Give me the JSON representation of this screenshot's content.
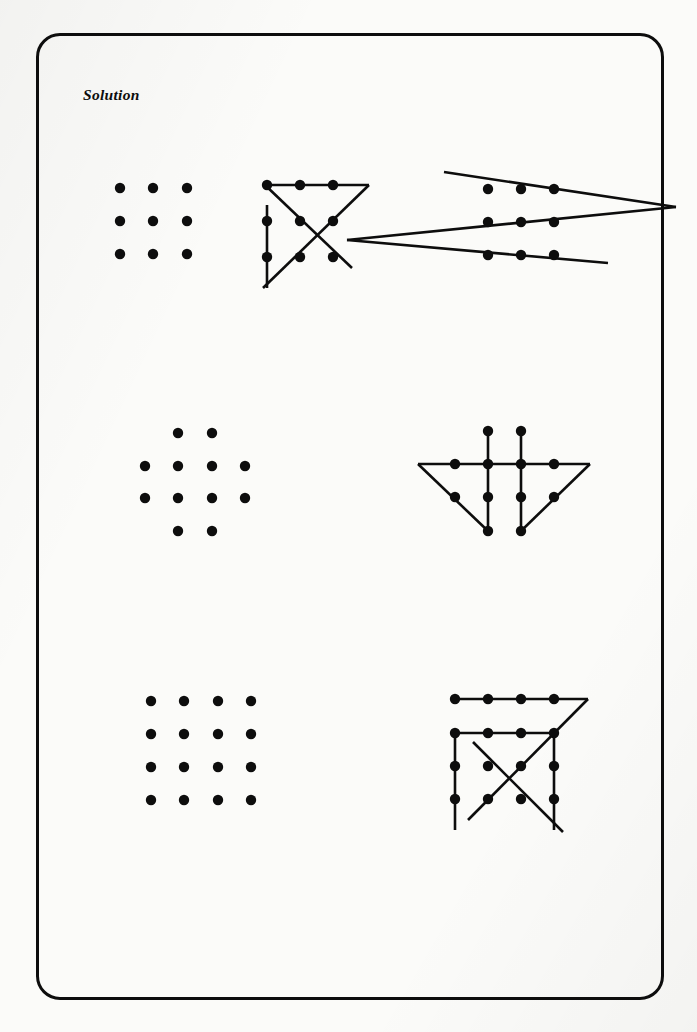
{
  "page": {
    "title": "Solution",
    "background_color": "#fbfbf9",
    "ink_color": "#0d0d0d",
    "border": {
      "x": 36,
      "y": 33,
      "width": 628,
      "height": 967,
      "radius": 24,
      "thickness": 3
    }
  },
  "puzzles": [
    {
      "id": "puzzle-1",
      "name": "nine-dot-three-by-three",
      "dot_radius": 5.2,
      "grid": {
        "name": "dot-grid-3x3",
        "rows": 3,
        "cols": 3,
        "dots": [
          {
            "x": 120,
            "y": 188
          },
          {
            "x": 153,
            "y": 188
          },
          {
            "x": 187,
            "y": 188
          },
          {
            "x": 120,
            "y": 221
          },
          {
            "x": 153,
            "y": 221
          },
          {
            "x": 187,
            "y": 221
          },
          {
            "x": 120,
            "y": 254
          },
          {
            "x": 153,
            "y": 254
          },
          {
            "x": 187,
            "y": 254
          }
        ]
      },
      "solutions": [
        {
          "name": "four-line-solution",
          "dots": [
            {
              "x": 267,
              "y": 185
            },
            {
              "x": 300,
              "y": 185
            },
            {
              "x": 333,
              "y": 185
            },
            {
              "x": 267,
              "y": 221
            },
            {
              "x": 300,
              "y": 221
            },
            {
              "x": 333,
              "y": 221
            },
            {
              "x": 267,
              "y": 257
            },
            {
              "x": 300,
              "y": 257
            },
            {
              "x": 333,
              "y": 257
            }
          ],
          "lines": [
            {
              "name": "top-horizontal",
              "x1": 267,
              "y1": 185,
              "x2": 369,
              "y2": 185
            },
            {
              "name": "diagonal-down-left",
              "x1": 369,
              "y1": 185,
              "x2": 263,
              "y2": 288
            },
            {
              "name": "left-vertical",
              "x1": 267,
              "y1": 205,
              "x2": 267,
              "y2": 288
            },
            {
              "name": "diagonal-up-right",
              "x1": 265,
              "y1": 185,
              "x2": 352,
              "y2": 268
            }
          ]
        },
        {
          "name": "three-line-solution",
          "dots": [
            {
              "x": 488,
              "y": 189
            },
            {
              "x": 521,
              "y": 189
            },
            {
              "x": 554,
              "y": 189
            },
            {
              "x": 488,
              "y": 222
            },
            {
              "x": 521,
              "y": 222
            },
            {
              "x": 554,
              "y": 222
            },
            {
              "x": 488,
              "y": 255
            },
            {
              "x": 521,
              "y": 255
            },
            {
              "x": 554,
              "y": 255
            }
          ],
          "lines": [
            {
              "name": "upper-line",
              "x1": 444,
              "y1": 172,
              "x2": 676,
              "y2": 207
            },
            {
              "name": "middle-line",
              "x1": 347,
              "y1": 240,
              "x2": 676,
              "y2": 207
            },
            {
              "name": "lower-line",
              "x1": 347,
              "y1": 240,
              "x2": 608,
              "y2": 263
            }
          ]
        }
      ]
    },
    {
      "id": "puzzle-2",
      "name": "twelve-dot-diamond",
      "dot_radius": 5.2,
      "grid": {
        "name": "dot-grid-diamond",
        "dots": [
          {
            "x": 178,
            "y": 433
          },
          {
            "x": 212,
            "y": 433
          },
          {
            "x": 145,
            "y": 466
          },
          {
            "x": 178,
            "y": 466
          },
          {
            "x": 212,
            "y": 466
          },
          {
            "x": 245,
            "y": 466
          },
          {
            "x": 145,
            "y": 498
          },
          {
            "x": 178,
            "y": 498
          },
          {
            "x": 212,
            "y": 498
          },
          {
            "x": 245,
            "y": 498
          },
          {
            "x": 178,
            "y": 531
          },
          {
            "x": 212,
            "y": 531
          }
        ]
      },
      "solutions": [
        {
          "name": "five-line-solution",
          "dots": [
            {
              "x": 488,
              "y": 431
            },
            {
              "x": 521,
              "y": 431
            },
            {
              "x": 455,
              "y": 464
            },
            {
              "x": 488,
              "y": 464
            },
            {
              "x": 521,
              "y": 464
            },
            {
              "x": 554,
              "y": 464
            },
            {
              "x": 455,
              "y": 497
            },
            {
              "x": 488,
              "y": 497
            },
            {
              "x": 521,
              "y": 497
            },
            {
              "x": 554,
              "y": 497
            },
            {
              "x": 488,
              "y": 531
            },
            {
              "x": 521,
              "y": 531
            }
          ],
          "lines": [
            {
              "name": "horizontal",
              "x1": 418,
              "y1": 464,
              "x2": 590,
              "y2": 464
            },
            {
              "name": "left-vertical",
              "x1": 488,
              "y1": 431,
              "x2": 488,
              "y2": 531
            },
            {
              "name": "right-vertical",
              "x1": 521,
              "y1": 431,
              "x2": 521,
              "y2": 531
            },
            {
              "name": "left-diagonal",
              "x1": 418,
              "y1": 464,
              "x2": 488,
              "y2": 531
            },
            {
              "name": "right-diagonal",
              "x1": 590,
              "y1": 464,
              "x2": 521,
              "y2": 531
            }
          ]
        }
      ]
    },
    {
      "id": "puzzle-3",
      "name": "sixteen-dot-four-by-four",
      "dot_radius": 5.2,
      "grid": {
        "name": "dot-grid-4x4",
        "rows": 4,
        "cols": 4,
        "dots": [
          {
            "x": 151,
            "y": 701
          },
          {
            "x": 184,
            "y": 701
          },
          {
            "x": 218,
            "y": 701
          },
          {
            "x": 251,
            "y": 701
          },
          {
            "x": 151,
            "y": 734
          },
          {
            "x": 184,
            "y": 734
          },
          {
            "x": 218,
            "y": 734
          },
          {
            "x": 251,
            "y": 734
          },
          {
            "x": 151,
            "y": 767
          },
          {
            "x": 184,
            "y": 767
          },
          {
            "x": 218,
            "y": 767
          },
          {
            "x": 251,
            "y": 767
          },
          {
            "x": 151,
            "y": 800
          },
          {
            "x": 184,
            "y": 800
          },
          {
            "x": 218,
            "y": 800
          },
          {
            "x": 251,
            "y": 800
          }
        ]
      },
      "solutions": [
        {
          "name": "six-line-solution",
          "dots": [
            {
              "x": 455,
              "y": 699
            },
            {
              "x": 488,
              "y": 699
            },
            {
              "x": 521,
              "y": 699
            },
            {
              "x": 554,
              "y": 699
            },
            {
              "x": 455,
              "y": 733
            },
            {
              "x": 488,
              "y": 733
            },
            {
              "x": 521,
              "y": 733
            },
            {
              "x": 554,
              "y": 733
            },
            {
              "x": 455,
              "y": 766
            },
            {
              "x": 488,
              "y": 766
            },
            {
              "x": 521,
              "y": 766
            },
            {
              "x": 554,
              "y": 766
            },
            {
              "x": 455,
              "y": 799
            },
            {
              "x": 488,
              "y": 799
            },
            {
              "x": 521,
              "y": 799
            },
            {
              "x": 554,
              "y": 799
            }
          ],
          "lines": [
            {
              "name": "top-horizontal",
              "x1": 455,
              "y1": 699,
              "x2": 588,
              "y2": 699
            },
            {
              "name": "second-horizontal",
              "x1": 455,
              "y1": 733,
              "x2": 554,
              "y2": 733
            },
            {
              "name": "corner-diagonal",
              "x1": 588,
              "y1": 699,
              "x2": 468,
              "y2": 820
            },
            {
              "name": "left-vertical",
              "x1": 455,
              "y1": 733,
              "x2": 455,
              "y2": 830
            },
            {
              "name": "right-vertical",
              "x1": 554,
              "y1": 733,
              "x2": 554,
              "y2": 830
            },
            {
              "name": "stub-diagonal",
              "x1": 473,
              "y1": 742,
              "x2": 563,
              "y2": 832
            }
          ]
        }
      ]
    }
  ]
}
